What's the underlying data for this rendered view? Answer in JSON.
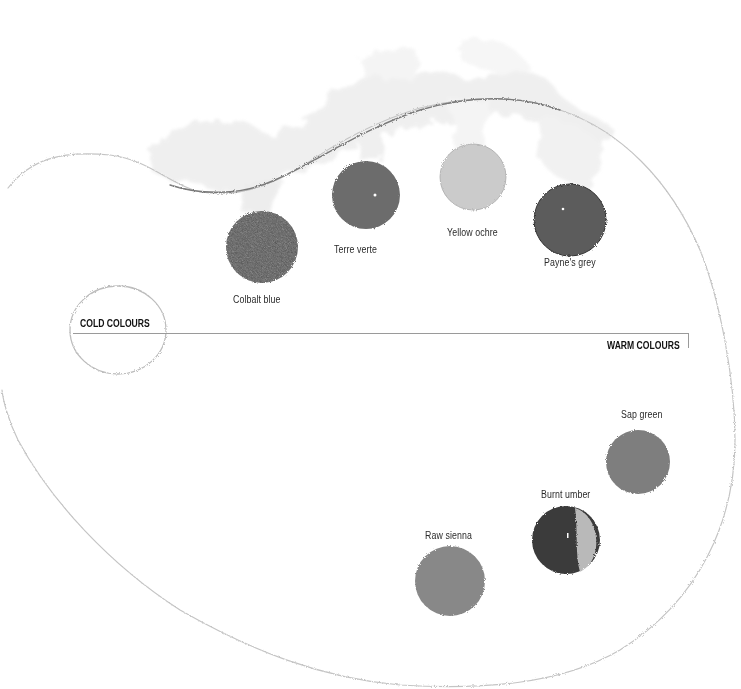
{
  "diagram": {
    "sections": {
      "cold_label": "COLD COLOURS",
      "warm_label": "WARM COLOURS"
    },
    "cold_colours": [
      {
        "name": "Colbalt blue",
        "swatch_color": "#5a5a5a"
      },
      {
        "name": "Terre verte",
        "swatch_color": "#6e6e6e"
      },
      {
        "name": "Yellow ochre",
        "swatch_color": "#c9c9c9"
      },
      {
        "name": "Payne's grey",
        "swatch_color": "#5e5e5e"
      }
    ],
    "warm_colours": [
      {
        "name": "Sap green",
        "swatch_color": "#808080"
      },
      {
        "name": "Burnt umber",
        "swatch_color": "#3f3f3f"
      },
      {
        "name": "Raw sienna",
        "swatch_color": "#8a8a8a"
      }
    ]
  }
}
